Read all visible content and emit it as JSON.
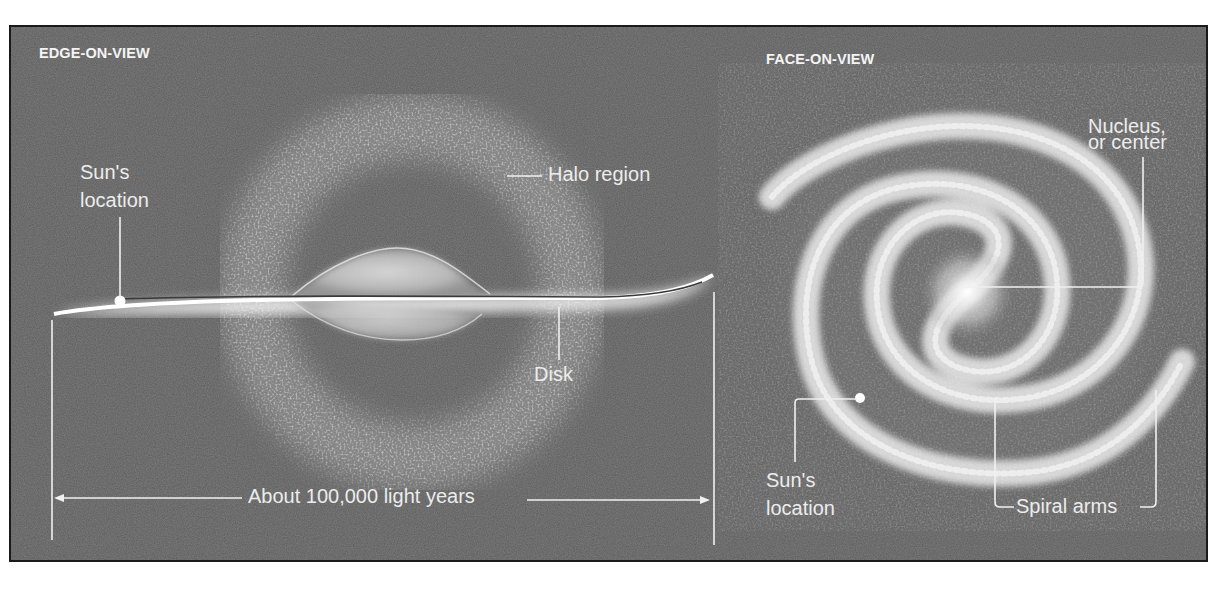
{
  "figure": {
    "panels": [
      {
        "id": "edge-on",
        "title": "EDGE-ON-VIEW",
        "labels": {
          "sun_location": [
            "Sun's",
            "location"
          ],
          "halo_region": "Halo region",
          "disk": "Disk",
          "scale": "About 100,000 light years"
        }
      },
      {
        "id": "face-on",
        "title": "FACE-ON-VIEW",
        "labels": {
          "nucleus": [
            "Nucleus,",
            "or center"
          ],
          "sun_location": [
            "Sun's",
            "location"
          ],
          "spiral_arms": "Spiral arms"
        }
      }
    ],
    "colors": {
      "background": "#5b5b5b",
      "frame_border": "#1a1a1a",
      "label_text": "#ececec",
      "leader_lines": "#f0f0f0"
    }
  }
}
